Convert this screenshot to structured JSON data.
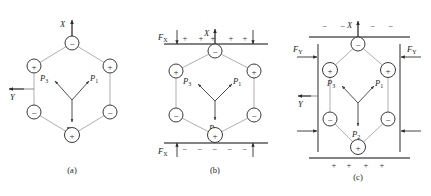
{
  "figure": {
    "colors": {
      "lattice_line": "#8d8d8d",
      "node_stroke": "#3a3a3a",
      "vector": "#3c3c3c",
      "plate": "#5a5a5a",
      "text": "#1a1a1a",
      "background": "#ffffff"
    }
  },
  "panels": [
    {
      "id": "a",
      "caption": "(a)",
      "axes": [
        {
          "name": "x-axis",
          "label": "X",
          "direction": "up"
        },
        {
          "name": "y-axis",
          "label": "Y",
          "direction": "left"
        }
      ],
      "nodes": [
        {
          "position": "top",
          "sign": "−"
        },
        {
          "position": "upper-left",
          "sign": "+"
        },
        {
          "position": "upper-right",
          "sign": "+"
        },
        {
          "position": "lower-left",
          "sign": "−"
        },
        {
          "position": "lower-right",
          "sign": "−"
        },
        {
          "position": "bottom",
          "sign": "+"
        }
      ],
      "vectors": [
        {
          "label": "P",
          "subscript": "3",
          "direction": "upper-left"
        },
        {
          "label": "P",
          "subscript": "1",
          "direction": "upper-right"
        },
        {
          "label": "P",
          "subscript": "2",
          "direction": "down"
        }
      ],
      "plates": [],
      "forces": [],
      "surface_charges": []
    },
    {
      "id": "b",
      "caption": "(b)",
      "axes": [
        {
          "name": "x-axis",
          "label": "X",
          "direction": "up"
        }
      ],
      "nodes": [
        {
          "position": "top",
          "sign": "−"
        },
        {
          "position": "upper-left",
          "sign": "+"
        },
        {
          "position": "upper-right",
          "sign": "+"
        },
        {
          "position": "lower-left",
          "sign": "−"
        },
        {
          "position": "lower-right",
          "sign": "−"
        },
        {
          "position": "bottom",
          "sign": "+"
        }
      ],
      "vectors": [
        {
          "label": "P",
          "subscript": "3",
          "direction": "upper-left"
        },
        {
          "label": "P",
          "subscript": "1",
          "direction": "upper-right"
        },
        {
          "label": "P",
          "subscript": "2",
          "direction": "down"
        }
      ],
      "plates": [
        {
          "name": "top-plate",
          "orientation": "horizontal"
        },
        {
          "name": "bottom-plate",
          "orientation": "horizontal"
        }
      ],
      "forces": [
        {
          "label": "F",
          "subscript": "X",
          "location": "top",
          "direction": "down"
        },
        {
          "label": "F",
          "subscript": "X",
          "location": "bottom",
          "direction": "up"
        }
      ],
      "surface_charges": [
        {
          "location": "top-plate",
          "sign": "+",
          "count": 5
        },
        {
          "location": "bottom-plate",
          "sign": "−",
          "count": 5
        }
      ]
    },
    {
      "id": "c",
      "caption": "(c)",
      "axes": [
        {
          "name": "x-axis",
          "label": "X",
          "direction": "up"
        },
        {
          "name": "y-axis",
          "label": "Y",
          "direction": "left"
        }
      ],
      "nodes": [
        {
          "position": "top",
          "sign": "−"
        },
        {
          "position": "upper-left",
          "sign": "+"
        },
        {
          "position": "upper-right",
          "sign": "+"
        },
        {
          "position": "lower-left",
          "sign": "−"
        },
        {
          "position": "lower-right",
          "sign": "−"
        },
        {
          "position": "bottom",
          "sign": "+"
        }
      ],
      "vectors": [
        {
          "label": "P",
          "subscript": "3",
          "direction": "upper-left"
        },
        {
          "label": "P",
          "subscript": "1",
          "direction": "upper-right"
        },
        {
          "label": "P",
          "subscript": "2",
          "direction": "down"
        }
      ],
      "plates": [
        {
          "name": "top-plate",
          "orientation": "horizontal"
        },
        {
          "name": "bottom-plate",
          "orientation": "horizontal"
        },
        {
          "name": "left-plate",
          "orientation": "vertical"
        },
        {
          "name": "right-plate",
          "orientation": "vertical"
        }
      ],
      "forces": [
        {
          "label": "F",
          "subscript": "Y",
          "location": "left",
          "direction": "right"
        },
        {
          "label": "F",
          "subscript": "Y",
          "location": "right",
          "direction": "left"
        }
      ],
      "surface_charges": [
        {
          "location": "top-plate",
          "sign": "−",
          "count": 4
        },
        {
          "location": "bottom-plate",
          "sign": "+",
          "count": 4
        }
      ]
    }
  ],
  "glyphs": {
    "plus": "+",
    "minus": "−",
    "node_plus": "+",
    "node_minus": "−"
  }
}
